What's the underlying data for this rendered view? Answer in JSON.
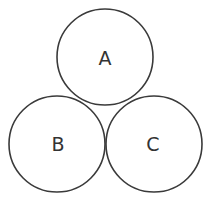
{
  "diagram": {
    "type": "three-tangent-circles",
    "stroke_color": "#3a3a3a",
    "background": "#ffffff",
    "circles": [
      {
        "id": "A",
        "label": "A",
        "cx": 105,
        "cy": 57,
        "r": 48
      },
      {
        "id": "B",
        "label": "B",
        "cx": 57,
        "cy": 144,
        "r": 48
      },
      {
        "id": "C",
        "label": "C",
        "cx": 154,
        "cy": 144,
        "r": 48
      }
    ]
  }
}
